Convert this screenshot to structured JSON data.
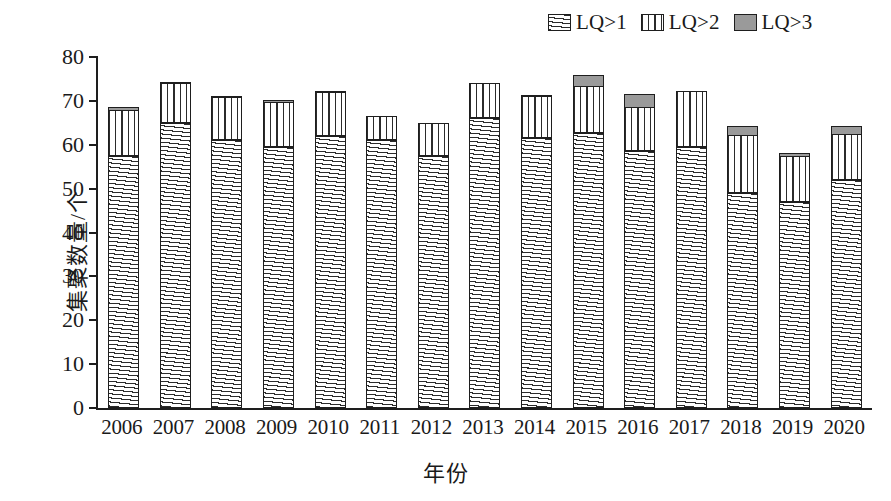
{
  "chart_data": {
    "type": "bar",
    "stacked": true,
    "title": "",
    "xlabel": "年份",
    "ylabel": "集聚数量/个",
    "ylim": [
      0,
      80
    ],
    "yticks": [
      0,
      10,
      20,
      30,
      40,
      50,
      60,
      70,
      80
    ],
    "grid": false,
    "legend_position": "top-right",
    "categories": [
      "2006",
      "2007",
      "2008",
      "2009",
      "2010",
      "2011",
      "2012",
      "2013",
      "2014",
      "2015",
      "2016",
      "2017",
      "2018",
      "2019",
      "2020"
    ],
    "series": [
      {
        "name": "LQ>1",
        "fill": "horizontal-hatch",
        "values": [
          57.5,
          65,
          61,
          59.5,
          62,
          61,
          57.5,
          66,
          61.5,
          62.7,
          58.5,
          59.5,
          49,
          47,
          52
        ]
      },
      {
        "name": "LQ>2",
        "fill": "vertical-hatch",
        "values": [
          10.5,
          9,
          9.8,
          10.3,
          10.1,
          5.5,
          7.5,
          8,
          9.6,
          10.8,
          10,
          12.7,
          13.2,
          10.5,
          10.5
        ]
      },
      {
        "name": "LQ>3",
        "fill": "solid-gray",
        "values": [
          1,
          0.7,
          0.7,
          0.7,
          0.4,
          0,
          0,
          0.5,
          0.4,
          2.8,
          3.5,
          0.3,
          2.3,
          0.9,
          2
        ]
      }
    ],
    "totals": [
      69,
      74.7,
      71.5,
      70.5,
      72.5,
      66.5,
      65,
      74.5,
      71.5,
      76.3,
      72,
      72.5,
      64.5,
      58.4,
      64.5
    ]
  },
  "legend": {
    "items": [
      {
        "label": "LQ>1",
        "swatch": "horizontal-hatch-swatch"
      },
      {
        "label": "LQ>2",
        "swatch": "vertical-hatch-swatch"
      },
      {
        "label": "LQ>3",
        "swatch": "solid-gray-swatch"
      }
    ]
  },
  "colors": {
    "axis": "#1e1e1e",
    "lq3_gray": "#9a9a9a",
    "background": "#ffffff"
  }
}
